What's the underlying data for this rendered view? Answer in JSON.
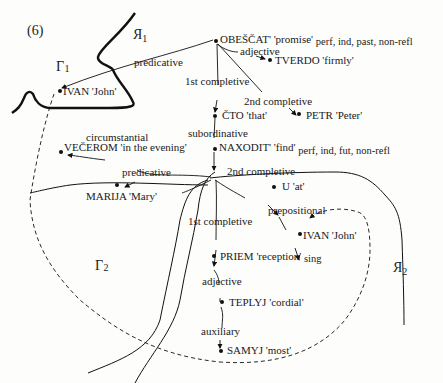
{
  "figure": {
    "number": "(6)",
    "regions": {
      "R1": {
        "letter": "R",
        "sub": "1"
      },
      "L1": {
        "letter": "L",
        "sub": "1"
      },
      "L2": {
        "letter": "L",
        "sub": "2"
      },
      "R2": {
        "letter": "R",
        "sub": "2"
      }
    },
    "nodes": {
      "obeschat": {
        "word": "OBEŠČAT'",
        "gloss": "'promise'",
        "grammar": "perf, ind, past, non-refl"
      },
      "tverdo": {
        "word": "TVERDO",
        "gloss": "'firmly'"
      },
      "ivan1": {
        "word": "IVAN",
        "gloss": "'John'"
      },
      "chto": {
        "word": "ČTO",
        "gloss": "'that'"
      },
      "petr": {
        "word": "PETR",
        "gloss": "'Peter'"
      },
      "vecherom": {
        "word": "VEČEROM",
        "gloss": "'in the evening'"
      },
      "naxodit": {
        "word": "NAXODIT'",
        "gloss": "'find'",
        "grammar": "perf, ind, fut, non-refl"
      },
      "marija": {
        "word": "MARIJA",
        "gloss": "'Mary'"
      },
      "u": {
        "word": "U",
        "gloss": "'at'"
      },
      "ivan2": {
        "word": "IVAN",
        "gloss": "'John'"
      },
      "priem": {
        "word": "PRIEM",
        "gloss": "'reception'",
        "grammar": "sing"
      },
      "teplyj": {
        "word": "TEPLYJ",
        "gloss": "'cordial'"
      },
      "samyj": {
        "word": "SAMYJ",
        "gloss": "'most'"
      }
    },
    "edges": {
      "predicative1": "predicative",
      "adjective1": "adjective",
      "completive1": "1st completive",
      "completive2a": "2nd completive",
      "subordinative": "subordinative",
      "circumstantial": "circumstantial",
      "predicative2": "predicative",
      "completive2b": "2nd completive",
      "prepositional": "prepositional",
      "completive1b": "1st completive",
      "adjective2": "adjective",
      "auxiliary": "auxiliary"
    }
  }
}
